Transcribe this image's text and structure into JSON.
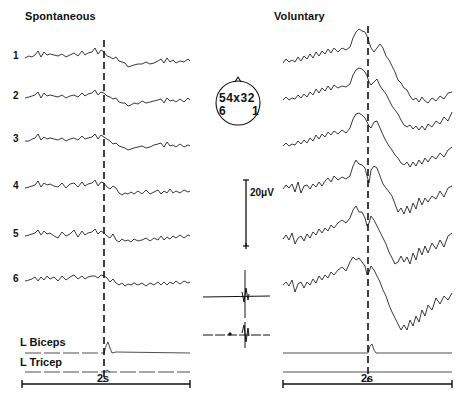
{
  "panels": {
    "left": {
      "title": "Spontaneous"
    },
    "right": {
      "title": "Voluntary"
    }
  },
  "channels": [
    "1",
    "2",
    "3",
    "4",
    "5",
    "6"
  ],
  "emg": {
    "biceps_label": "L Biceps",
    "triceps_label": "L Tricep"
  },
  "time_scale": {
    "left_label": "2s",
    "right_label": "2s"
  },
  "amplitude_scale": {
    "label": "20μV",
    "top_sign": "−",
    "bottom_sign": "+"
  },
  "electrode_map": {
    "row1": "54x32",
    "row2_left": "6",
    "row2_right": "1"
  },
  "colors": {
    "ink": "#111111",
    "background": "#ffffff",
    "faded": "#666666"
  }
}
